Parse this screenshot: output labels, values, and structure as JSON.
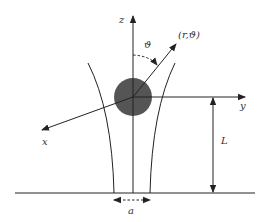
{
  "diagram": {
    "type": "physics-geometry",
    "colors": {
      "stroke": "#222222",
      "sphere_fill": "#555555",
      "label": "#333333",
      "background": "#ffffff"
    },
    "labels": {
      "z_axis": "z",
      "y_axis": "y",
      "x_axis": "x",
      "polar_point": "(r,ϑ)",
      "polar_angle": "ϑ",
      "height": "L",
      "gap_width": "a"
    },
    "elements": {
      "sphere": {
        "cx": 133,
        "cy": 97,
        "r": 19
      },
      "z_axis": {
        "x": 133,
        "y_top": 15,
        "y_bottom": 193
      },
      "y_axis": {
        "x1": 133,
        "y1": 97,
        "x2": 245,
        "y2": 97
      },
      "x_axis": {
        "x1": 133,
        "y1": 97,
        "x2": 42,
        "y2": 130
      },
      "r_vector": {
        "x1": 133,
        "y1": 97,
        "x2": 176,
        "y2": 44
      },
      "ground_line": {
        "x1": 15,
        "x2": 255,
        "y": 193
      },
      "height_arrow": {
        "x": 213,
        "y_top": 97,
        "y_bottom": 193
      },
      "gap_arrow": {
        "x1": 114,
        "x2": 150,
        "y": 200
      }
    }
  }
}
